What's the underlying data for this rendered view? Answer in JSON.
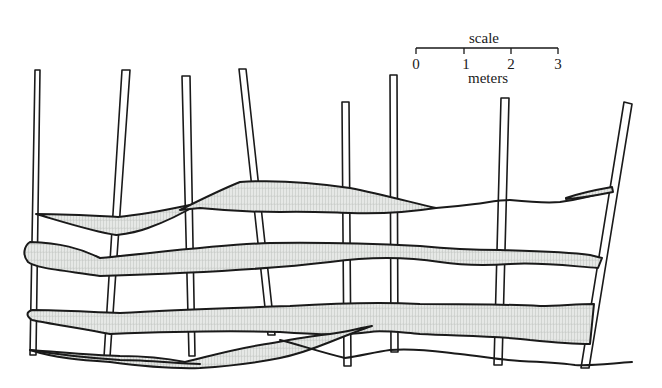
{
  "figure": {
    "colors": {
      "ink": "#1a1a1a",
      "plank_fill": "#e6e8e6",
      "plank_grain": "#b9bdb9",
      "background": "#ffffff"
    }
  },
  "scale_bar": {
    "title": "scale",
    "unit": "meters",
    "ticks": [
      "0",
      "1",
      "2",
      "3"
    ]
  },
  "posts": [
    {
      "id": "post-1"
    },
    {
      "id": "post-2"
    },
    {
      "id": "post-3"
    },
    {
      "id": "post-4"
    },
    {
      "id": "post-5"
    },
    {
      "id": "post-6"
    },
    {
      "id": "post-7"
    },
    {
      "id": "post-8"
    }
  ],
  "planks": [
    {
      "id": "plank-top-left"
    },
    {
      "id": "plank-top-center"
    },
    {
      "id": "plank-upper-middle"
    },
    {
      "id": "plank-lower-middle"
    },
    {
      "id": "plank-bottom"
    },
    {
      "id": "plank-stub-right"
    }
  ]
}
